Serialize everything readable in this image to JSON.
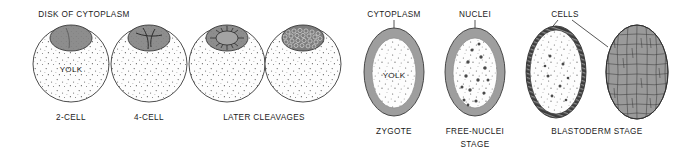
{
  "figure": {
    "background_color": "#ffffff",
    "ink_color": "#1a1a1a"
  },
  "colors": {
    "cytoplasm_gray": "#9e9e9e",
    "yolk_white": "#fdfdfd",
    "cap_gray": "#8d8d8d",
    "cell_gray": "#9a9a9a",
    "outline": "#3a3a3a"
  },
  "left_panel": {
    "top_label": "DISK OF CYTOPLASM",
    "interior_label": "YOLK",
    "stages": [
      {
        "label": "2-CELL",
        "cap_type": "two-cell",
        "cells": 2
      },
      {
        "label": "4-CELL",
        "cap_type": "four-cell",
        "cells": 4
      },
      {
        "label": "LATER CLEAVAGES",
        "cap_type": "radial-cells",
        "cells": 16
      },
      {
        "label": "",
        "cap_type": "many-cells",
        "cells": 40
      }
    ],
    "shared_label": "LATER CLEAVAGES"
  },
  "right_panel": {
    "top_labels": [
      "CYTOPLASM",
      "NUCLEI",
      "CELLS"
    ],
    "interior_label": "YOLK",
    "stages": [
      {
        "label": "ZYGOTE",
        "label_line2": "",
        "type": "zygote"
      },
      {
        "label": "FREE-NUCLEI",
        "label_line2": "STAGE",
        "type": "free-nuclei"
      },
      {
        "label": "BLASTODERM STAGE",
        "label_line2": "",
        "type": "blastoderm-section"
      },
      {
        "label": "",
        "label_line2": "",
        "type": "blastoderm-surface"
      }
    ],
    "shared_label": "BLASTODERM STAGE"
  },
  "labels": {
    "disk_of_cytoplasm": "DISK OF CYTOPLASM",
    "yolk": "YOLK",
    "two_cell": "2-CELL",
    "four_cell": "4-CELL",
    "later_cleavages": "LATER CLEAVAGES",
    "cytoplasm": "CYTOPLASM",
    "nuclei": "NUCLEI",
    "cells": "CELLS",
    "zygote": "ZYGOTE",
    "free_nuclei": "FREE-NUCLEI",
    "stage": "STAGE",
    "blastoderm_stage": "BLASTODERM STAGE"
  }
}
